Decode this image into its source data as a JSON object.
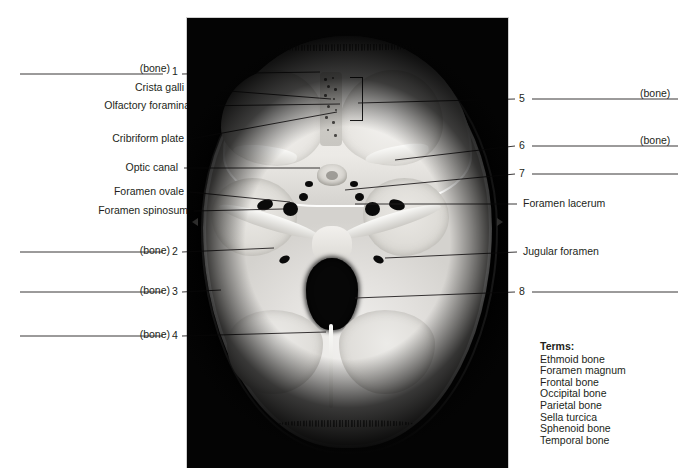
{
  "figure": {
    "photo_alt": "Photograph of the internal skull base showing anterior, middle and posterior cranial fossae"
  },
  "left_labels": [
    {
      "id": "l1",
      "text": "(bone)",
      "number": "1",
      "blank": true
    },
    {
      "id": "l2",
      "text": "Crista galli",
      "number": "",
      "blank": false
    },
    {
      "id": "l3",
      "text": "Olfactory foramina",
      "number": "",
      "blank": false
    },
    {
      "id": "l4",
      "text": "Cribriform plate",
      "number": "",
      "blank": false
    },
    {
      "id": "l5",
      "text": "Optic canal",
      "number": "",
      "blank": false
    },
    {
      "id": "l6",
      "text": "Foramen ovale",
      "number": "",
      "blank": false
    },
    {
      "id": "l7",
      "text": "Foramen spinosum",
      "number": "",
      "blank": false
    },
    {
      "id": "l8",
      "text": "(bone)",
      "number": "2",
      "blank": true
    },
    {
      "id": "l9",
      "text": "(bone)",
      "number": "3",
      "blank": true
    },
    {
      "id": "l10",
      "text": "(bone)",
      "number": "4",
      "blank": true
    }
  ],
  "right_labels": [
    {
      "id": "r1",
      "text": "(bone)",
      "number": "5",
      "blank": true
    },
    {
      "id": "r2",
      "text": "(bone)",
      "number": "6",
      "blank": true
    },
    {
      "id": "r3",
      "text": "",
      "number": "7",
      "blank": true
    },
    {
      "id": "r4",
      "text": "Foramen lacerum",
      "number": "",
      "blank": false
    },
    {
      "id": "r5",
      "text": "Jugular foramen",
      "number": "",
      "blank": false
    },
    {
      "id": "r6",
      "text": "",
      "number": "8",
      "blank": true
    }
  ],
  "terms": {
    "heading": "Terms:",
    "items": [
      "Ethmoid bone",
      "Foramen magnum",
      "Frontal bone",
      "Occipital bone",
      "Parietal bone",
      "Sella turcica",
      "Sphenoid bone",
      "Temporal bone"
    ]
  },
  "colors": {
    "text": "#231f20",
    "leader": "#231f20",
    "background": "#ffffff",
    "photo_background": "#050505",
    "bone": "#e6e4e0"
  }
}
